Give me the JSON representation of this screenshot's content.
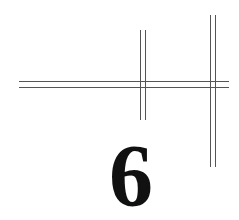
{
  "chapter": {
    "number": "6"
  },
  "decoration": {
    "line_color": "#555555",
    "text_color": "#111111"
  }
}
